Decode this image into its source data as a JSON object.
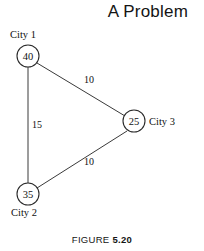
{
  "title": "A Problem",
  "caption": {
    "prefix": "FIGURE",
    "number": "5.20"
  },
  "chart_data": {
    "type": "diagram",
    "title": "A Problem",
    "diagram_kind": "undirected-weighted-graph",
    "nodes": [
      {
        "id": "city1",
        "label": "City 1",
        "value": "40",
        "cx": 28,
        "cy": 56,
        "r": 11,
        "label_x": 10,
        "label_y": 38,
        "label_anchor": "start"
      },
      {
        "id": "city3",
        "label": "City 3",
        "value": "25",
        "cx": 134,
        "cy": 121,
        "r": 11,
        "label_x": 149,
        "label_y": 125,
        "label_anchor": "start"
      },
      {
        "id": "city2",
        "label": "City 2",
        "value": "35",
        "cx": 28,
        "cy": 194,
        "r": 11,
        "label_x": 11,
        "label_y": 216,
        "label_anchor": "start"
      }
    ],
    "edges": [
      {
        "id": "e-city1-city3",
        "from": "city1",
        "to": "city3",
        "weight": "10",
        "x1": 37,
        "y1": 63,
        "x2": 125,
        "y2": 116,
        "label_x": 89,
        "label_y": 83
      },
      {
        "id": "e-city1-city2",
        "from": "city1",
        "to": "city2",
        "weight": "15",
        "x1": 28,
        "y1": 67,
        "x2": 28,
        "y2": 183,
        "label_x": 37,
        "label_y": 128
      },
      {
        "id": "e-city2-city3",
        "from": "city2",
        "to": "city3",
        "weight": "10",
        "x1": 37,
        "y1": 188,
        "x2": 127,
        "y2": 131,
        "label_x": 89,
        "label_y": 165
      }
    ],
    "xlabel": "",
    "ylabel": "",
    "legend": [],
    "grid": false
  }
}
